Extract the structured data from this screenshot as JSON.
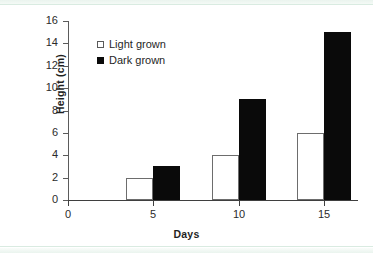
{
  "chart_data": {
    "type": "bar",
    "title": "",
    "xlabel": "Days",
    "ylabel": "Height (cm)",
    "categories": [
      "5",
      "10",
      "15"
    ],
    "x": [
      5,
      10,
      15
    ],
    "series": [
      {
        "name": "Light grown",
        "values": [
          2,
          4,
          6
        ],
        "fill": "#ffffff",
        "stroke": "#6d6d6d"
      },
      {
        "name": "Dark grown",
        "values": [
          3,
          9,
          15
        ],
        "fill": "#0a0a0a",
        "stroke": "#0a0a0a"
      }
    ],
    "ylim": [
      0,
      16
    ],
    "yticks": [
      0,
      2,
      4,
      6,
      8,
      10,
      12,
      14,
      16
    ],
    "xlim": [
      0,
      17
    ],
    "xticks": [
      0,
      5,
      10,
      15
    ],
    "xtick_labels": [
      "0",
      "5",
      "10",
      "15"
    ],
    "grid": false,
    "legend_position": "upper-left-inside"
  },
  "legend": {
    "items": [
      {
        "label": "Light grown",
        "marker": "open-square"
      },
      {
        "label": "Dark grown",
        "marker": "filled-square"
      }
    ]
  },
  "axes": {
    "y_title": "Height (cm)",
    "x_title": "Days",
    "y_tick_labels": [
      "16",
      "14",
      "12",
      "10",
      "8",
      "6",
      "4",
      "2",
      "0"
    ],
    "x_tick_labels": [
      "0",
      "5",
      "10",
      "15"
    ]
  }
}
